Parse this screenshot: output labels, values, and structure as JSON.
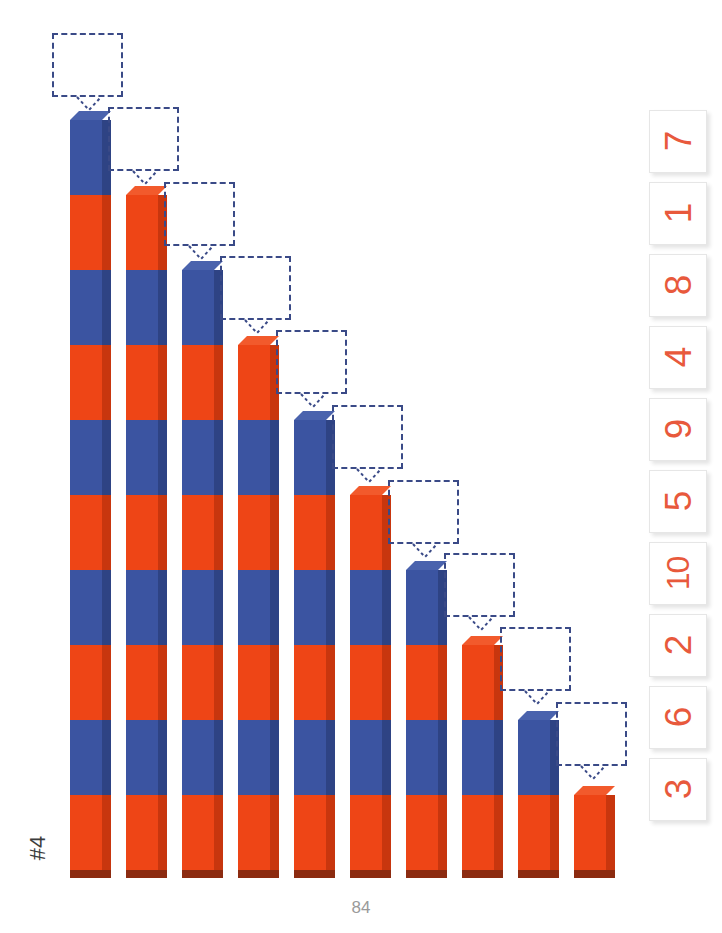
{
  "worksheet": {
    "exercise_label": "#4",
    "page_number": "84",
    "unit_px": 75,
    "baseline_y": 870,
    "colors": {
      "rod_blue": "#3b54a1",
      "rod_orange": "#ee4516",
      "rod_blue_side": "#2e4384",
      "rod_orange_side": "#c8360e",
      "rod_bottom_shadow": "#8c2b10",
      "callout_border": "#3a4a87",
      "card_text": "#e8593c",
      "card_border": "#e6e6e6",
      "page_number_color": "#9a9a9a",
      "background": "#ffffff"
    }
  },
  "rods": [
    {
      "index": 1,
      "units": 10,
      "top_color": "blue",
      "left": 70,
      "top": 118
    },
    {
      "index": 2,
      "units": 9,
      "top_color": "orange",
      "left": 126,
      "top": 193
    },
    {
      "index": 3,
      "units": 8,
      "top_color": "blue",
      "left": 182,
      "top": 263
    },
    {
      "index": 4,
      "units": 7,
      "top_color": "orange",
      "left": 238,
      "top": 338
    },
    {
      "index": 5,
      "units": 6,
      "top_color": "blue",
      "left": 294,
      "top": 413
    },
    {
      "index": 6,
      "units": 5,
      "top_color": "orange",
      "left": 350,
      "top": 488
    },
    {
      "index": 7,
      "units": 4,
      "top_color": "blue",
      "left": 406,
      "top": 563
    },
    {
      "index": 8,
      "units": 3,
      "top_color": "orange",
      "left": 462,
      "top": 635
    },
    {
      "index": 9,
      "units": 2,
      "top_color": "blue",
      "left": 518,
      "top": 710
    },
    {
      "index": 10,
      "units": 1,
      "top_color": "orange",
      "left": 574,
      "top": 785
    }
  ],
  "callouts": [
    {
      "for_rod": 1,
      "left": 52,
      "top": 33,
      "width": 71,
      "height": 64,
      "value": ""
    },
    {
      "for_rod": 2,
      "left": 108,
      "top": 107,
      "width": 71,
      "height": 64,
      "value": ""
    },
    {
      "for_rod": 3,
      "left": 164,
      "top": 182,
      "width": 71,
      "height": 64,
      "value": ""
    },
    {
      "for_rod": 4,
      "left": 220,
      "top": 256,
      "width": 71,
      "height": 64,
      "value": ""
    },
    {
      "for_rod": 5,
      "left": 276,
      "top": 330,
      "width": 71,
      "height": 64,
      "value": ""
    },
    {
      "for_rod": 6,
      "left": 332,
      "top": 405,
      "width": 71,
      "height": 64,
      "value": ""
    },
    {
      "for_rod": 7,
      "left": 388,
      "top": 480,
      "width": 71,
      "height": 64,
      "value": ""
    },
    {
      "for_rod": 8,
      "left": 444,
      "top": 553,
      "width": 71,
      "height": 64,
      "value": ""
    },
    {
      "for_rod": 9,
      "left": 500,
      "top": 627,
      "width": 71,
      "height": 64,
      "value": ""
    },
    {
      "for_rod": 10,
      "left": 556,
      "top": 702,
      "width": 71,
      "height": 64,
      "value": ""
    }
  ],
  "number_cards": [
    {
      "value": "7",
      "top": 110
    },
    {
      "value": "1",
      "top": 182
    },
    {
      "value": "8",
      "top": 254
    },
    {
      "value": "4",
      "top": 326
    },
    {
      "value": "9",
      "top": 398
    },
    {
      "value": "5",
      "top": 470
    },
    {
      "value": "10",
      "top": 542
    },
    {
      "value": "2",
      "top": 614
    },
    {
      "value": "6",
      "top": 686
    },
    {
      "value": "3",
      "top": 758
    }
  ]
}
